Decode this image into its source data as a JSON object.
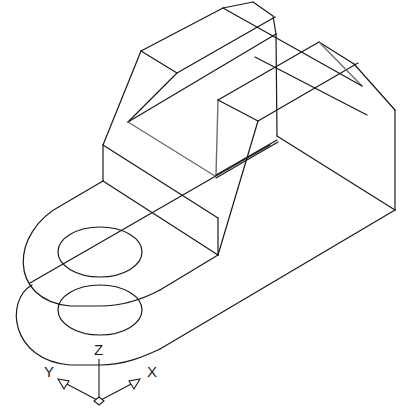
{
  "drawing": {
    "view": "isometric wireframe",
    "colors": {
      "background": "#ffffff",
      "edge": "#1a1a1a",
      "hidden_edge": "#6e6e6e"
    }
  },
  "ucs_icon": {
    "z_label": "Z",
    "y_label": "Y",
    "x_label": "X"
  }
}
